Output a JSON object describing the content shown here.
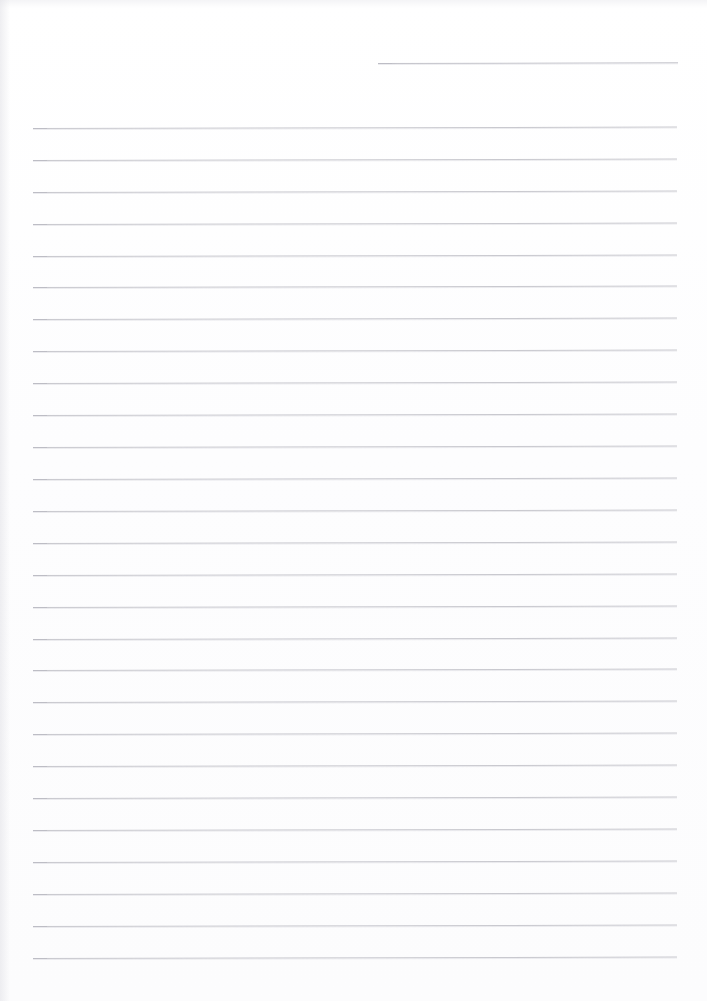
{
  "document": {
    "kind": "scanned-blank-lined-paper",
    "page_label": "",
    "visible_text": "",
    "background_color": "#fefeff",
    "rule_color": "#c9c9cf",
    "page_width": 707,
    "page_height": 1001
  },
  "header_rule": {
    "name": "header-date-rule",
    "x_start": 378,
    "x_end": 678,
    "y": 63,
    "width": 300,
    "color": "#c4c4cb"
  },
  "body_rules": {
    "count": 27,
    "x_start": 33,
    "x_end": 677,
    "width": 644,
    "first_y": 128,
    "spacing": 31.9,
    "color": "#c9c9cf",
    "y_positions": [
      128,
      160,
      192,
      224,
      256,
      287,
      319,
      351,
      383,
      415,
      447,
      479,
      511,
      543,
      575,
      607,
      639,
      670,
      702,
      734,
      766,
      798,
      830,
      862,
      894,
      926,
      958
    ]
  },
  "margins": {
    "left": 33,
    "right": 30,
    "top": 63,
    "bottom": 43
  }
}
